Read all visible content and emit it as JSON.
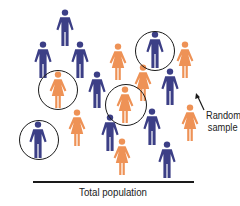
{
  "colors": {
    "male": "#3c3f86",
    "female": "#ee9256",
    "ring": "#1a1a1a",
    "text": "#222222"
  },
  "labels": {
    "sample": [
      "Random",
      "sample"
    ],
    "population": "Total population"
  },
  "people": [
    {
      "type": "male",
      "x": 65,
      "y": 28,
      "sampled": false
    },
    {
      "type": "male",
      "x": 43,
      "y": 60,
      "sampled": false
    },
    {
      "type": "male",
      "x": 80,
      "y": 60,
      "sampled": false
    },
    {
      "type": "female",
      "x": 118,
      "y": 62,
      "sampled": false
    },
    {
      "type": "male",
      "x": 155,
      "y": 50,
      "sampled": true
    },
    {
      "type": "female",
      "x": 185,
      "y": 60,
      "sampled": false
    },
    {
      "type": "female",
      "x": 58,
      "y": 90,
      "sampled": true
    },
    {
      "type": "male",
      "x": 97,
      "y": 90,
      "sampled": false
    },
    {
      "type": "female",
      "x": 143,
      "y": 83,
      "sampled": false
    },
    {
      "type": "male",
      "x": 170,
      "y": 87,
      "sampled": false
    },
    {
      "type": "female",
      "x": 125,
      "y": 105,
      "sampled": true
    },
    {
      "type": "female",
      "x": 77,
      "y": 128,
      "sampled": false
    },
    {
      "type": "male",
      "x": 38,
      "y": 140,
      "sampled": true
    },
    {
      "type": "male",
      "x": 110,
      "y": 133,
      "sampled": false
    },
    {
      "type": "male",
      "x": 152,
      "y": 127,
      "sampled": false
    },
    {
      "type": "female",
      "x": 190,
      "y": 123,
      "sampled": false
    },
    {
      "type": "female",
      "x": 122,
      "y": 157,
      "sampled": false
    },
    {
      "type": "male",
      "x": 167,
      "y": 160,
      "sampled": false
    }
  ],
  "rings": [
    {
      "cx": 155,
      "cy": 51,
      "r": 20
    },
    {
      "cx": 58,
      "cy": 90,
      "r": 20
    },
    {
      "cx": 126,
      "cy": 105,
      "r": 21
    },
    {
      "cx": 39,
      "cy": 140,
      "r": 20
    }
  ]
}
